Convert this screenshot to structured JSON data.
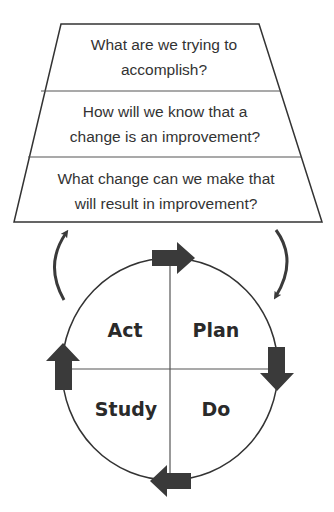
{
  "diagram": {
    "colors": {
      "stroke": "#333333",
      "arrow_fill": "#3a3a3a",
      "text": "#333333",
      "background": "#ffffff"
    },
    "questions": [
      {
        "line1": "What are we trying to",
        "line2": "accomplish?"
      },
      {
        "line1": "How will we know that a",
        "line2": "change is an improvement?"
      },
      {
        "line1": "What change can we make that",
        "line2": "will result in improvement?"
      }
    ],
    "cycle": {
      "quadrants": {
        "top_left": "Act",
        "top_right": "Plan",
        "bottom_left": "Study",
        "bottom_right": "Do"
      },
      "direction": "clockwise"
    },
    "connectors": [
      {
        "name": "cycle-to-questions",
        "direction": "up",
        "side": "left"
      },
      {
        "name": "questions-to-cycle",
        "direction": "down",
        "side": "right"
      }
    ]
  }
}
